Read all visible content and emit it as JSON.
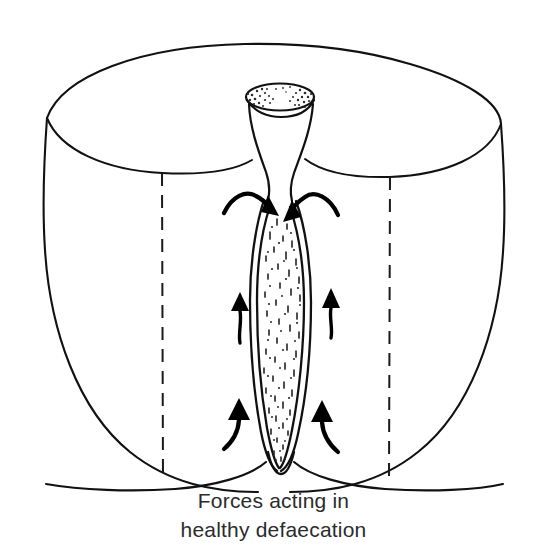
{
  "figure": {
    "title": "Forces acting in healthy defaecation",
    "caption": {
      "line1": "Forces acting in",
      "line2": "healthy defaecation"
    },
    "colors": {
      "ink": "#111111",
      "arrow": "#000000",
      "background": "#ffffff",
      "caption_text": "#2b2b2b",
      "cut_plane": "#1a1a1a"
    },
    "parts": [
      {
        "name": "abdominal-wall-outline",
        "label": "abdominal cavity outline"
      },
      {
        "name": "pelvic-rim-ellipse",
        "label": "upper rim of abdominal cavity"
      },
      {
        "name": "funnel-opening",
        "label": "funnel-shaped upper rectum"
      },
      {
        "name": "funnel-rim-stipple",
        "label": "stippled mucosal rim"
      },
      {
        "name": "rectal-canal",
        "label": "rectum and anal canal with contents"
      },
      {
        "name": "canal-stipple-fill",
        "label": "faecal content texture"
      },
      {
        "name": "cut-plane-left",
        "label": "left sagittal cut plane"
      },
      {
        "name": "cut-plane-right",
        "label": "right sagittal cut plane"
      }
    ],
    "force_arrows": [
      {
        "name": "arrow-inward-left",
        "direction": "down-inward",
        "label": "pelvic floor force, left",
        "position": "upper-centre-left"
      },
      {
        "name": "arrow-inward-right",
        "direction": "down-inward",
        "label": "pelvic floor force, right",
        "position": "upper-centre-right"
      },
      {
        "name": "arrow-upward-left-upper",
        "direction": "up",
        "label": "abdominal pressure, upper left",
        "position": "mid-left"
      },
      {
        "name": "arrow-upward-right-upper",
        "direction": "up",
        "label": "abdominal pressure, upper right",
        "position": "mid-right"
      },
      {
        "name": "arrow-upward-left-lower",
        "direction": "up-curved",
        "label": "abdominal pressure, lower left",
        "position": "lower-left"
      },
      {
        "name": "arrow-upward-right-lower",
        "direction": "up-curved",
        "label": "abdominal pressure, lower right",
        "position": "lower-right"
      }
    ],
    "arrow_count_total": "6",
    "arrow_count_inward": "2",
    "arrow_count_upward": "4"
  }
}
